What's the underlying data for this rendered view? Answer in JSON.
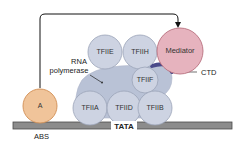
{
  "diagram": {
    "colors": {
      "factor_fill": "#CDD3E2",
      "factor_stroke": "#9AA3B8",
      "polymerase_fill": "#B9C2D6",
      "activator_fill": "#F0C49A",
      "activator_stroke": "#D18E55",
      "mediator_fill": "#E6B3BE",
      "mediator_stroke": "#B9707F",
      "ctd_color": "#4A4A8A",
      "dna_fill": "#8C8C8C",
      "dna_stroke": "#4A4A4A"
    },
    "nodes": {
      "activator": "A",
      "mediator": "Mediator",
      "tfiie": "TFIIE",
      "tfiih": "TFIIH",
      "tfiif": "TFIIF",
      "tfiia": "TFIIA",
      "tfiid": "TFIID",
      "tfiib": "TFIIB"
    },
    "labels": {
      "rna_line1": "RNA",
      "rna_line2": "polymerase",
      "ctd": "CTD",
      "abs": "ABS",
      "tata": "TATA"
    },
    "edges": [
      {
        "from": "A",
        "to": "Mediator",
        "type": "arrow"
      }
    ]
  }
}
